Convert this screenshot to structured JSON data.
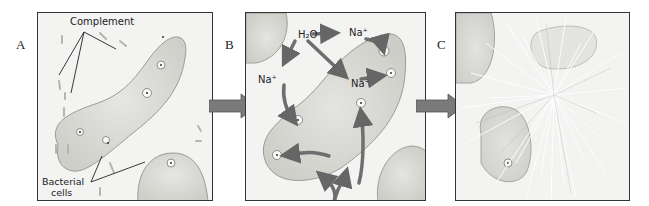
{
  "figure": {
    "panels": [
      {
        "id": "A",
        "letter": "A",
        "labels": {
          "complement": "Complement",
          "bacterial_line1": "Bacterial",
          "bacterial_line2": "cells"
        }
      },
      {
        "id": "B",
        "letter": "B",
        "labels": {
          "water": "H₂O",
          "sodium_1": "Na⁺",
          "sodium_2": "Na⁺",
          "sodium_3": "Na⁺"
        }
      },
      {
        "id": "C",
        "letter": "C"
      }
    ],
    "transition_arrows": [
      "A-to-B",
      "B-to-C"
    ],
    "colors": {
      "panel_bg": "#f3f3f2",
      "panel_border": "#333333",
      "cell_fill": "#dcdcd8",
      "cell_stroke": "#9a9a96",
      "arrow_fill": "#777777",
      "text": "#222222"
    }
  }
}
